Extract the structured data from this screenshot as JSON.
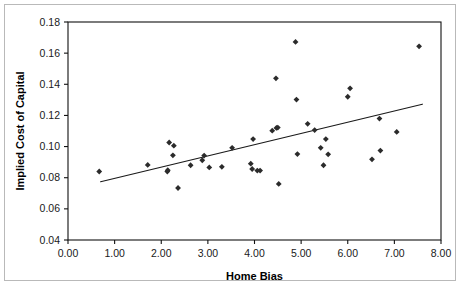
{
  "figure": {
    "background_color": "#ffffff",
    "frame_color": "#b9b9b9",
    "axis_color": "#111111",
    "marker_color": "#2b2b2b",
    "trend_color": "#1a1a1a"
  },
  "chart_data": {
    "type": "scatter",
    "title": "",
    "subtitle": "",
    "xlabel": "Home Bias",
    "ylabel": "Implied Cost of Capital",
    "xlim": [
      0.0,
      8.0
    ],
    "ylim": [
      0.04,
      0.18
    ],
    "xticks": [
      0.0,
      1.0,
      2.0,
      3.0,
      4.0,
      5.0,
      6.0,
      7.0,
      8.0
    ],
    "xtick_labels": [
      "0.00",
      "1.00",
      "2.00",
      "3.00",
      "4.00",
      "5.00",
      "6.00",
      "7.00",
      "8.00"
    ],
    "yticks": [
      0.04,
      0.06,
      0.08,
      0.1,
      0.12,
      0.14,
      0.16,
      0.18
    ],
    "ytick_labels": [
      "0.04",
      "0.06",
      "0.08",
      "0.10",
      "0.12",
      "0.14",
      "0.16",
      "0.18"
    ],
    "grid": false,
    "legend": false,
    "legend_position": "none",
    "marker": "diamond",
    "series": [
      {
        "name": "Countries",
        "points": [
          [
            0.67,
            0.084
          ],
          [
            1.71,
            0.0882
          ],
          [
            2.13,
            0.084
          ],
          [
            2.14,
            0.0848
          ],
          [
            2.17,
            0.1026
          ],
          [
            2.27,
            0.1006
          ],
          [
            2.25,
            0.0944
          ],
          [
            2.36,
            0.0734
          ],
          [
            2.63,
            0.088
          ],
          [
            2.88,
            0.0912
          ],
          [
            2.92,
            0.0942
          ],
          [
            3.03,
            0.0866
          ],
          [
            3.3,
            0.087
          ],
          [
            3.52,
            0.0992
          ],
          [
            3.92,
            0.089
          ],
          [
            3.95,
            0.0856
          ],
          [
            3.97,
            0.1048
          ],
          [
            4.06,
            0.0846
          ],
          [
            4.12,
            0.0846
          ],
          [
            4.38,
            0.1102
          ],
          [
            4.47,
            0.112
          ],
          [
            4.5,
            0.1122
          ],
          [
            4.46,
            0.1438
          ],
          [
            4.52,
            0.076
          ],
          [
            4.88,
            0.1672
          ],
          [
            4.9,
            0.1302
          ],
          [
            4.92,
            0.0952
          ],
          [
            5.14,
            0.1146
          ],
          [
            5.29,
            0.1106
          ],
          [
            5.42,
            0.0992
          ],
          [
            5.48,
            0.088
          ],
          [
            5.53,
            0.1048
          ],
          [
            5.58,
            0.095
          ],
          [
            6.0,
            0.132
          ],
          [
            6.05,
            0.1374
          ],
          [
            6.52,
            0.0918
          ],
          [
            6.68,
            0.118
          ],
          [
            6.7,
            0.0974
          ],
          [
            7.05,
            0.1094
          ],
          [
            7.53,
            0.1644
          ]
        ]
      }
    ],
    "trend_line": {
      "name": "Fitted regression line",
      "x_start": 0.7,
      "y_start": 0.0774,
      "x_end": 7.6,
      "y_end": 0.1272
    }
  }
}
